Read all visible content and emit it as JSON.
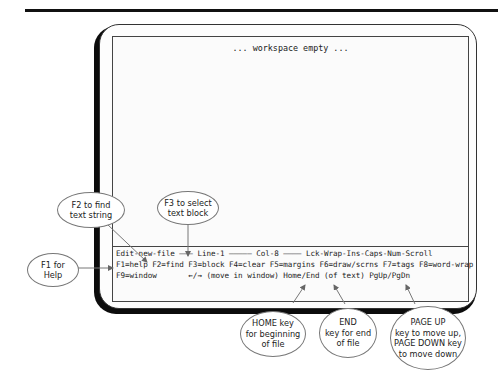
{
  "screen": {
    "workspace_message": "... workspace empty ...",
    "status_bar": {
      "line1": "Edit-new-file ——— Line-1 ————— Col-8 ———— Lck-Wrap-Ins-Caps-Num-Scroll",
      "line2": "F1=help F2=find F3=block F4=clear F5=margins F6=draw/scrns F7=tags F8=word-wrap",
      "line3": "F9=window       ←/→ (move in window) Home/End (of text) PgUp/PgDn"
    }
  },
  "callouts": {
    "f1": [
      "F1 for",
      "Help"
    ],
    "f2": [
      "F2 to find",
      "text string"
    ],
    "f3": [
      "F3 to select",
      "text block"
    ],
    "home": [
      "HOME key",
      "for beginning",
      "of file"
    ],
    "end": [
      "END",
      "key for end",
      "of file"
    ],
    "page": [
      "PAGE UP",
      "key to move up,",
      "PAGE DOWN key",
      "to move down"
    ]
  },
  "colors": {
    "frame": "#0c0c0c",
    "callout_border": "#777777",
    "arrow": "#666666"
  }
}
